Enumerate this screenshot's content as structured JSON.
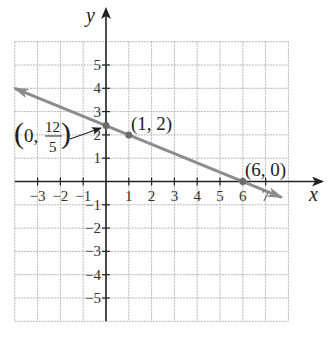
{
  "chart_data": {
    "type": "line",
    "title": "",
    "xlabel": "x",
    "ylabel": "y",
    "xlim": [
      -4,
      8
    ],
    "ylim": [
      -6,
      6
    ],
    "grid": true,
    "x_ticks": [
      -3,
      -2,
      -1,
      1,
      2,
      3,
      4,
      5,
      6,
      7
    ],
    "x_tick_labels": [
      "−3",
      "−2",
      "−1",
      "1",
      "2",
      "3",
      "4",
      "5",
      "6",
      "7"
    ],
    "y_ticks": [
      5,
      4,
      3,
      2,
      1,
      -1,
      -2,
      -3,
      -4,
      -5
    ],
    "y_tick_labels": [
      "5",
      "4",
      "3",
      "2",
      "1",
      "−1",
      "−2",
      "−3",
      "−4",
      "−5"
    ],
    "series": [
      {
        "name": "line",
        "equation": "y = -2/5 x + 12/5",
        "x": [
          -4,
          7.7
        ],
        "y": [
          4,
          -0.68
        ],
        "arrows": "both",
        "color": "#8c8c8c"
      }
    ],
    "points": [
      {
        "x": 0,
        "y": 2.4,
        "label": "(0, 12/5)"
      },
      {
        "x": 1,
        "y": 2,
        "label": "(1, 2)"
      },
      {
        "x": 6,
        "y": 0,
        "label": "(6, 0)"
      }
    ],
    "annotations": [
      {
        "text": "(0, 12/5)",
        "points_to": {
          "x": 0,
          "y": 2.4
        },
        "with_arrow": true
      },
      {
        "text": "(1, 2)",
        "near": {
          "x": 1,
          "y": 2
        }
      },
      {
        "text": "(6, 0)",
        "near": {
          "x": 6,
          "y": 0
        }
      }
    ]
  },
  "labels": {
    "x_axis": "x",
    "y_axis": "y",
    "point_a_open": "(0,",
    "point_a_num": "12",
    "point_a_den": "5",
    "point_b": "(1, 2)",
    "point_c": "(6, 0)"
  },
  "colors": {
    "grid": "#b5b5b5",
    "axis": "#222222",
    "line": "#8c8c8c",
    "text": "#222222"
  }
}
